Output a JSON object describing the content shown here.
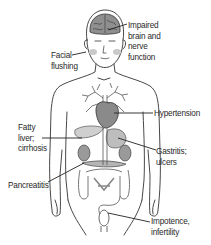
{
  "diagram": {
    "title": "",
    "colors": {
      "line": "#333333",
      "organ_fill": "#9a9a9a",
      "heart_fill": "#8a8a8a",
      "label_text": "#2a2a2a",
      "background": "#ffffff"
    },
    "labels": [
      {
        "id": "brain",
        "lines": [
          "Impaired",
          "brain and",
          "nerve",
          "function"
        ],
        "target": "brain"
      },
      {
        "id": "face",
        "lines": [
          "Facial",
          "flushing"
        ],
        "target": "cheek"
      },
      {
        "id": "heart",
        "lines": [
          "Hypertension"
        ],
        "target": "heart"
      },
      {
        "id": "liver",
        "lines": [
          "Fatty",
          "liver;",
          "cirrhosis"
        ],
        "target": "liver"
      },
      {
        "id": "stomach",
        "lines": [
          "Gastritis;",
          "ulcers"
        ],
        "target": "stomach"
      },
      {
        "id": "pancreas",
        "lines": [
          "Pancreatitis"
        ],
        "target": "pancreas"
      },
      {
        "id": "reproductive",
        "lines": [
          "Impotence,",
          "infertility"
        ],
        "target": "genitals"
      }
    ]
  }
}
